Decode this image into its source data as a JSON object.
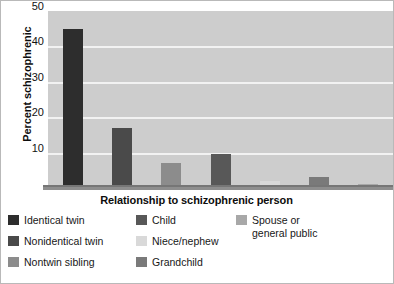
{
  "chart_data": {
    "type": "bar",
    "title": "",
    "xlabel": "Relationship to schizophrenic person",
    "ylabel": "Percent schizophrenic",
    "categories": [
      "Identical twin",
      "Nonidentical twin",
      "Nontwin sibling",
      "Child",
      "Niece/nephew",
      "Grandchild",
      "Spouse or general public"
    ],
    "values": [
      45,
      17,
      7,
      9.5,
      2,
      3,
      1
    ],
    "ylim": [
      0,
      50
    ],
    "yticks": [
      10,
      20,
      30,
      40,
      50
    ],
    "ytick_labels": [
      "10",
      "20",
      "30",
      "40",
      "50"
    ],
    "grid": true,
    "legend_position": "bottom",
    "bar_colors": [
      "#2d2d2d",
      "#4a4a4a",
      "#8c8c8c",
      "#585858",
      "#d9d9d9",
      "#7a7a7a",
      "#a8a8a8"
    ],
    "plot_background": "#cdcdcd",
    "gridline_color": "#f2f2f2"
  },
  "legend": {
    "items": [
      {
        "label": "Identical twin",
        "color": "#2d2d2d",
        "col": 0,
        "row": 0
      },
      {
        "label": "Nonidentical twin",
        "color": "#4a4a4a",
        "col": 0,
        "row": 1
      },
      {
        "label": "Nontwin sibling",
        "color": "#8c8c8c",
        "col": 0,
        "row": 2
      },
      {
        "label": "Child",
        "color": "#585858",
        "col": 1,
        "row": 0
      },
      {
        "label": "Niece/nephew",
        "color": "#d9d9d9",
        "col": 1,
        "row": 1
      },
      {
        "label": "Grandchild",
        "color": "#7a7a7a",
        "col": 1,
        "row": 2
      },
      {
        "label": "Spouse or\ngeneral public",
        "color": "#a8a8a8",
        "col": 2,
        "row": 0
      }
    ]
  }
}
